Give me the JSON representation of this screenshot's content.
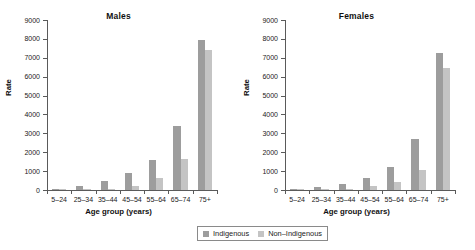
{
  "chart_data": {
    "type": "bar",
    "title": "",
    "panels": [
      {
        "title": "Males",
        "xlabel": "Age group (years)",
        "ylabel": "Rate",
        "categories": [
          "5–24",
          "25–34",
          "35–44",
          "45–54",
          "55–64",
          "65–74",
          "75+"
        ],
        "series": [
          {
            "name": "Indigenous",
            "values": [
              50,
              220,
              470,
              900,
              1570,
              3370,
              7920
            ]
          },
          {
            "name": "Non-Indigenous",
            "values": [
              10,
              20,
              40,
              230,
              620,
              1630,
              7400
            ]
          }
        ],
        "ylim": [
          0,
          9000
        ],
        "yticks": [
          0,
          1000,
          2000,
          3000,
          4000,
          5000,
          6000,
          7000,
          8000,
          9000
        ]
      },
      {
        "title": "Females",
        "xlabel": "Age group (years)",
        "ylabel": "Rate",
        "categories": [
          "5–24",
          "25–34",
          "35–44",
          "45–54",
          "55–64",
          "65–74",
          "75+"
        ],
        "series": [
          {
            "name": "Indigenous",
            "values": [
              60,
              150,
              320,
              620,
              1230,
              2680,
              7250
            ]
          },
          {
            "name": "Non-Indigenous",
            "values": [
              10,
              30,
              70,
              200,
              400,
              1040,
              6480
            ]
          }
        ],
        "ylim": [
          0,
          9000
        ],
        "yticks": [
          0,
          1000,
          2000,
          3000,
          4000,
          5000,
          6000,
          7000,
          8000,
          9000
        ]
      }
    ],
    "legend": {
      "position": "bottom-center",
      "entries": [
        {
          "label": "Indigenous",
          "color": "#9d9d9d"
        },
        {
          "label": "Non–Indigenous",
          "color": "#c4c4c4"
        }
      ]
    },
    "grid": false,
    "colors": {
      "indigenous": "#9d9d9d",
      "non_indigenous": "#c4c4c4",
      "axis": "#5a5a5a",
      "text": "#1a1a1a",
      "background": "#ffffff"
    }
  }
}
